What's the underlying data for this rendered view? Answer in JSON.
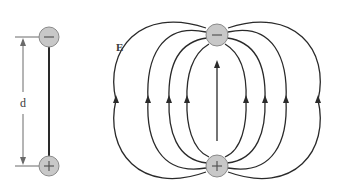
{
  "figure": {
    "dipole": {
      "negative_charge_label": "−",
      "positive_charge_label": "+",
      "separation_label": "d"
    },
    "field": {
      "field_label": "E",
      "negative_charge_label": "−",
      "positive_charge_label": "+",
      "field_line_count_left": 4,
      "field_line_count_right": 4,
      "arrow_direction": "up"
    },
    "colors": {
      "line": "#2a2a2a",
      "charge_fill": "#c8c8c8",
      "charge_stroke": "#8a8a8a",
      "dimension_line": "#6a6a6a",
      "text": "#3a3a3a"
    }
  }
}
